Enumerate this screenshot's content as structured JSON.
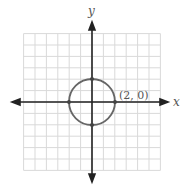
{
  "chart_data": {
    "type": "line",
    "title": "",
    "xlabel": "x",
    "ylabel": "y",
    "xlim": [
      -6,
      6
    ],
    "ylim": [
      -6,
      6
    ],
    "grid": true,
    "legend": null,
    "series": [
      {
        "name": "circle x^2 + y^2 = 4",
        "shape": "circle",
        "center": [
          0,
          0
        ],
        "radius": 2,
        "color": "#666666"
      }
    ],
    "points": [
      {
        "x": 2,
        "y": 0
      },
      {
        "x": -2,
        "y": 0
      },
      {
        "x": 0,
        "y": 2
      },
      {
        "x": 0,
        "y": -2
      }
    ],
    "annotations": [
      {
        "text": "(2, 0)",
        "x": 2,
        "y": 0
      }
    ]
  },
  "labels": {
    "x_axis": "x",
    "y_axis": "y",
    "point_label": "(2, 0)"
  },
  "colors": {
    "grid": "#d9d9d9",
    "axes": "#222222",
    "circle": "#666666"
  }
}
